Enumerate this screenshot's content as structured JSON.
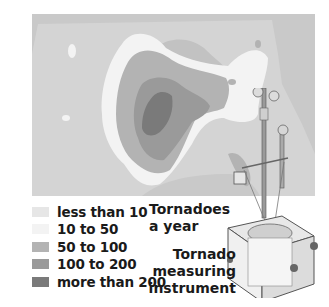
{
  "map": {
    "title": "Tornadoes a year",
    "title_lines": [
      "Tornadoes",
      "a year"
    ],
    "region": "United States"
  },
  "legend": {
    "items": [
      {
        "label": "less than 10",
        "color": "#e6e6e6"
      },
      {
        "label": "10 to 50",
        "color": "#f3f3f3"
      },
      {
        "label": "50 to 100",
        "color": "#b3b3b3"
      },
      {
        "label": "100 to 200",
        "color": "#9a9a9a"
      },
      {
        "label": "more than 200",
        "color": "#7a7a7a"
      }
    ]
  },
  "instrument": {
    "caption_lines": [
      "Tornado",
      "measuring",
      "instrument"
    ]
  },
  "colors": {
    "background": "#c9c9c9",
    "land_low": "#d6d6d6",
    "band_10_50": "#f3f3f3",
    "band_50_100": "#b3b3b3",
    "band_100_200": "#9a9a9a",
    "band_200_plus": "#7a7a7a"
  }
}
